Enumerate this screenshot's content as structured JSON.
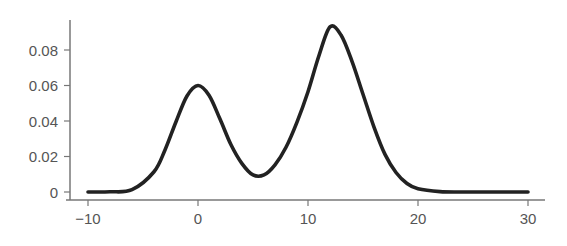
{
  "chart_data": {
    "type": "line",
    "title": "",
    "xlabel": "",
    "ylabel": "",
    "xlim": [
      -10,
      30
    ],
    "ylim": [
      0,
      0.095
    ],
    "grid": false,
    "legend": null,
    "x_ticks": [
      -10,
      0,
      10,
      20,
      30
    ],
    "x_tick_labels": [
      "−10",
      "0",
      "10",
      "20",
      "30"
    ],
    "y_ticks": [
      0,
      0.02,
      0.04,
      0.06,
      0.08
    ],
    "y_tick_labels": [
      "0",
      "0.02",
      "0.04",
      "0.06",
      "0.08"
    ],
    "series": [
      {
        "name": "density",
        "description": "Bimodal density: mixture of two Gaussians (mean 0, sd ~2.2, weight ~1/3; mean 12, sd ~2.9, weight ~2/3)",
        "x": [
          -10,
          -8,
          -6,
          -4,
          -3,
          -2,
          -1,
          0,
          1,
          2,
          3,
          4,
          5,
          6,
          7,
          8,
          9,
          10,
          11,
          12,
          13,
          14,
          15,
          16,
          17,
          18,
          19,
          20,
          22,
          24,
          26,
          28,
          30
        ],
        "y": [
          0.0,
          0.0001,
          0.0013,
          0.0114,
          0.0237,
          0.0396,
          0.0541,
          0.06,
          0.0545,
          0.0411,
          0.0266,
          0.016,
          0.0096,
          0.0096,
          0.0153,
          0.0252,
          0.0394,
          0.0565,
          0.0769,
          0.093,
          0.0884,
          0.0736,
          0.0551,
          0.0366,
          0.0212,
          0.011,
          0.0048,
          0.0018,
          0.0002,
          0.0,
          0.0,
          0.0,
          0.0
        ]
      }
    ],
    "peaks": [
      {
        "x": 0,
        "y": 0.06
      },
      {
        "x": 12,
        "y": 0.093
      }
    ],
    "trough": {
      "x": 5,
      "y": 0.008
    },
    "colors": {
      "line": "#222222",
      "axis": "#777777",
      "tick_label": "#555555"
    }
  }
}
